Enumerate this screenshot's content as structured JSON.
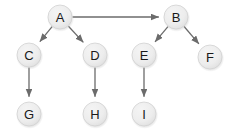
{
  "diagram": {
    "type": "directed-graph",
    "title": "",
    "background_color": "#ffffff",
    "node_fill_color": "#e9e9e9",
    "node_stroke_color": "#d2d2d2",
    "node_label_color": "#1a1a1a",
    "edge_color": "#6b6b6b",
    "node_radius": 12,
    "nodes": [
      {
        "id": "A",
        "label": "A",
        "cx": 60,
        "cy": 17
      },
      {
        "id": "B",
        "label": "B",
        "cx": 176,
        "cy": 17
      },
      {
        "id": "C",
        "label": "C",
        "cx": 29,
        "cy": 55
      },
      {
        "id": "D",
        "label": "D",
        "cx": 95,
        "cy": 55
      },
      {
        "id": "E",
        "label": "E",
        "cx": 144,
        "cy": 55
      },
      {
        "id": "F",
        "label": "F",
        "cx": 210,
        "cy": 57
      },
      {
        "id": "G",
        "label": "G",
        "cx": 29,
        "cy": 114
      },
      {
        "id": "H",
        "label": "H",
        "cx": 95,
        "cy": 114
      },
      {
        "id": "I",
        "label": "I",
        "cx": 144,
        "cy": 114
      }
    ],
    "edges": [
      {
        "from": "A",
        "to": "B",
        "directed": true
      },
      {
        "from": "A",
        "to": "C",
        "directed": true
      },
      {
        "from": "A",
        "to": "D",
        "directed": true
      },
      {
        "from": "B",
        "to": "E",
        "directed": true
      },
      {
        "from": "B",
        "to": "F",
        "directed": true
      },
      {
        "from": "C",
        "to": "G",
        "directed": true
      },
      {
        "from": "D",
        "to": "H",
        "directed": true
      },
      {
        "from": "E",
        "to": "I",
        "directed": true
      }
    ]
  }
}
